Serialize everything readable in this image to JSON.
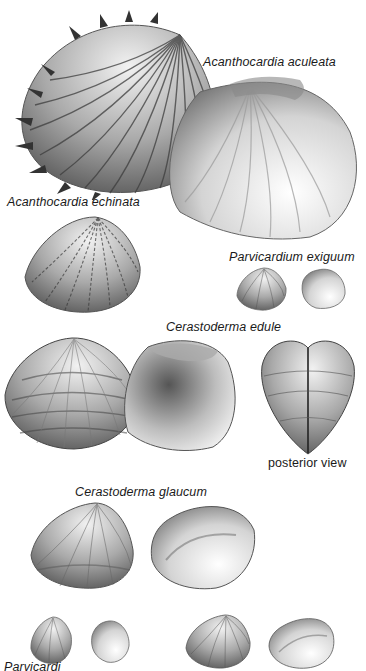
{
  "plate": {
    "title": "Cockles (Cardiidae) illustration plate",
    "species": [
      {
        "id": "aculeata",
        "label": "Acanthocardia aculeata"
      },
      {
        "id": "echinata",
        "label": "Acanthocardia echinata"
      },
      {
        "id": "exiguum",
        "label": "Parvicardium exiguum"
      },
      {
        "id": "edule",
        "label": "Cerastoderma edule"
      },
      {
        "id": "glaucum",
        "label": "Cerastoderma glaucum"
      },
      {
        "id": "partial",
        "label": "Parvicardium..."
      }
    ],
    "annotations": {
      "posterior": "posterior view",
      "bottom_cut": "Parvicardi"
    }
  },
  "colors": {
    "background": "#ffffff",
    "ink": "#1a1a1a",
    "shell_dark": "#4a4a4a",
    "shell_mid": "#8a8a8a",
    "shell_light": "#d8d8d8"
  }
}
